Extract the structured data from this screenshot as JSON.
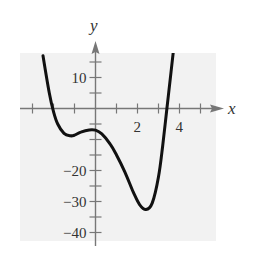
{
  "chart_data": {
    "type": "line",
    "title": "",
    "xlabel": "x",
    "ylabel": "y",
    "xlim": [
      -3,
      5
    ],
    "ylim": [
      -40,
      17
    ],
    "x_ticks": [
      -3,
      -2,
      -1,
      0,
      1,
      2,
      3,
      4,
      5
    ],
    "x_tick_labels": [
      {
        "value": 2,
        "label": "2"
      },
      {
        "value": 4,
        "label": "4"
      }
    ],
    "y_ticks": [
      -40,
      -35,
      -30,
      -25,
      -20,
      -15,
      -10,
      -5,
      0,
      5,
      10,
      15
    ],
    "y_tick_labels": [
      {
        "value": 10,
        "label": "10"
      },
      {
        "value": -20,
        "label": "−20"
      },
      {
        "value": -30,
        "label": "−30"
      },
      {
        "value": -40,
        "label": "−40"
      }
    ],
    "grid": false,
    "background": "#f2f2f2",
    "series": [
      {
        "name": "f(x)",
        "color": "#111111",
        "x": [
          -2.5,
          -2.2,
          -2.0,
          -1.8,
          -1.5,
          -1.2,
          -1.0,
          -0.7,
          -0.3,
          0.0,
          0.3,
          0.7,
          1.0,
          1.4,
          1.8,
          2.1,
          2.4,
          2.7,
          3.0,
          3.2,
          3.4,
          3.6,
          3.7
        ],
        "y": [
          17,
          5,
          -1,
          -5,
          -8,
          -8.8,
          -8.6,
          -7.6,
          -6.9,
          -7,
          -8.2,
          -11.5,
          -15,
          -20.5,
          -27,
          -31,
          -32.6,
          -30.5,
          -22,
          -12,
          0,
          12,
          18
        ]
      }
    ]
  }
}
